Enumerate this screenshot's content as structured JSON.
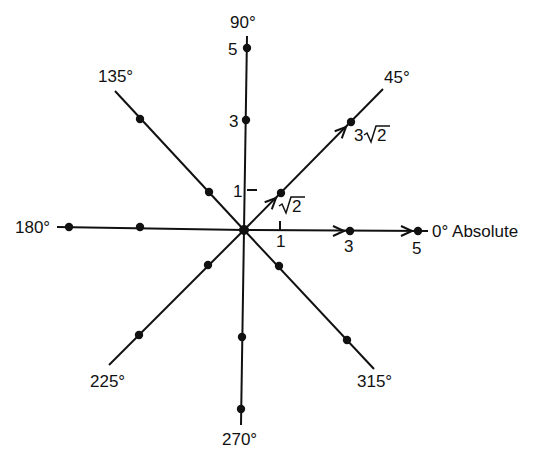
{
  "diagram": {
    "type": "phasor-star",
    "center": [
      244,
      230
    ],
    "colors": {
      "ink": "#111111",
      "background": "#ffffff"
    },
    "axes": [
      {
        "id": "a0",
        "label": "0° Absolute",
        "angle": 0,
        "end": [
          428,
          231
        ],
        "label_pos": [
          432,
          237
        ]
      },
      {
        "id": "a45",
        "label": "45°",
        "angle": 45,
        "end": [
          383,
          89
        ],
        "label_pos": [
          384,
          83
        ]
      },
      {
        "id": "a90",
        "label": "90°",
        "angle": 90,
        "end": [
          247,
          36
        ],
        "label_pos": [
          230,
          28
        ]
      },
      {
        "id": "a135",
        "label": "135°",
        "angle": 135,
        "end": [
          115,
          91
        ],
        "label_pos": [
          98,
          82
        ]
      },
      {
        "id": "a180",
        "label": "180°",
        "angle": 180,
        "end": [
          57,
          227
        ],
        "label_pos": [
          15,
          233
        ]
      },
      {
        "id": "a225",
        "label": "225°",
        "angle": 225,
        "end": [
          109,
          365
        ],
        "label_pos": [
          90,
          387
        ]
      },
      {
        "id": "a270",
        "label": "270°",
        "angle": 270,
        "end": [
          241,
          425
        ],
        "label_pos": [
          222,
          445
        ]
      },
      {
        "id": "a315",
        "label": "315°",
        "angle": 315,
        "end": [
          374,
          369
        ],
        "label_pos": [
          357,
          387
        ]
      }
    ],
    "points": [
      {
        "axis": "a90",
        "pos": [
          247,
          48
        ]
      },
      {
        "axis": "a90",
        "pos": [
          246,
          120
        ]
      },
      {
        "axis": "a0",
        "pos": [
          350,
          231
        ]
      },
      {
        "axis": "a0",
        "pos": [
          418,
          231
        ]
      },
      {
        "axis": "a45",
        "pos": [
          281,
          193
        ]
      },
      {
        "axis": "a45",
        "pos": [
          351,
          122
        ]
      },
      {
        "axis": "a135",
        "pos": [
          140,
          119
        ]
      },
      {
        "axis": "a135",
        "pos": [
          209,
          192
        ]
      },
      {
        "axis": "a180",
        "pos": [
          69,
          227
        ]
      },
      {
        "axis": "a180",
        "pos": [
          140,
          227
        ]
      },
      {
        "axis": "a225",
        "pos": [
          208,
          265
        ]
      },
      {
        "axis": "a225",
        "pos": [
          139,
          335
        ]
      },
      {
        "axis": "a270",
        "pos": [
          242,
          337
        ]
      },
      {
        "axis": "a270",
        "pos": [
          241,
          409
        ]
      },
      {
        "axis": "a315",
        "pos": [
          279,
          266
        ]
      },
      {
        "axis": "a315",
        "pos": [
          347,
          340
        ]
      }
    ],
    "magnitude_labels": [
      {
        "text": "5",
        "pos": [
          228,
          55
        ]
      },
      {
        "text": "3",
        "pos": [
          229,
          127
        ]
      },
      {
        "text": "1",
        "pos": [
          233,
          197
        ]
      },
      {
        "text": "1",
        "pos": [
          276,
          247
        ]
      },
      {
        "text": "3",
        "pos": [
          344,
          252
        ]
      },
      {
        "text": "5",
        "pos": [
          412,
          254
        ]
      }
    ],
    "root_labels": [
      {
        "id": "sqrt2",
        "coef": "",
        "radicand": "2",
        "pos": [
          279,
          212
        ]
      },
      {
        "id": "3sqrt2",
        "coef": "3",
        "radicand": "2",
        "pos": [
          354,
          141
        ]
      }
    ],
    "arrows": [
      {
        "on": "a45",
        "tip": [
          276,
          198
        ],
        "dir": 45
      },
      {
        "on": "a45",
        "tip": [
          346,
          127
        ],
        "dir": 45
      },
      {
        "on": "a0",
        "tip": [
          344,
          231
        ],
        "dir": 0
      },
      {
        "on": "a0",
        "tip": [
          412,
          231
        ],
        "dir": 0
      }
    ],
    "ticks": [
      {
        "from": [
          247,
          190
        ],
        "to": [
          257,
          190
        ]
      },
      {
        "from": [
          280,
          231
        ],
        "to": [
          280,
          221
        ]
      }
    ]
  }
}
